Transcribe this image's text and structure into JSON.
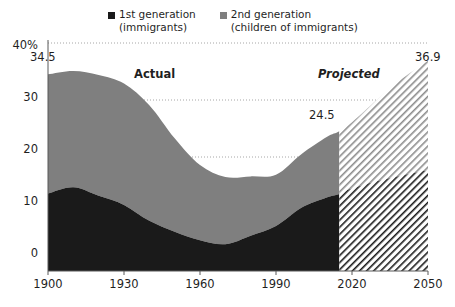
{
  "chart_data": {
    "type": "area",
    "subtype": "stacked-area",
    "title": "",
    "xlabel": "",
    "ylabel": "",
    "xlim": [
      1900,
      2050
    ],
    "ylim": [
      0,
      40
    ],
    "xticks": [
      "1900",
      "1930",
      "1960",
      "1990",
      "2020",
      "2050"
    ],
    "xtick_values": [
      1900,
      1930,
      1960,
      1990,
      2020,
      2050
    ],
    "yticks": [
      "0",
      "10",
      "20",
      "30",
      "40%"
    ],
    "ytick_values": [
      0,
      10,
      20,
      30,
      40
    ],
    "grid": "horizontal-dotted",
    "legend_position": "top-center",
    "projection_start_year": 2015,
    "series": [
      {
        "name": "1st generation (immigrants)",
        "color": "#1a1a1a",
        "x": [
          1900,
          1910,
          1920,
          1930,
          1940,
          1950,
          1960,
          1970,
          1980,
          1990,
          2000,
          2010,
          2015,
          2020,
          2030,
          2040,
          2050
        ],
        "values": [
          13.6,
          14.7,
          13.2,
          11.6,
          8.8,
          6.9,
          5.4,
          4.7,
          6.2,
          7.9,
          11.1,
          12.9,
          13.5,
          14.5,
          15.8,
          16.8,
          17.7
        ]
      },
      {
        "name": "2nd generation (children of immigrants)",
        "color": "#7f7f7f",
        "x": [
          1900,
          1910,
          1920,
          1930,
          1940,
          1950,
          1960,
          1970,
          1980,
          1990,
          2000,
          2010,
          2015,
          2020,
          2030,
          2040,
          2050
        ],
        "values": [
          20.9,
          20.4,
          21.2,
          21.3,
          20.3,
          16.4,
          13.2,
          11.8,
          10.4,
          9.0,
          9.4,
          10.6,
          11.0,
          11.6,
          14.3,
          17.0,
          19.2
        ]
      }
    ],
    "totals": {
      "x": [
        1900,
        1910,
        1920,
        1930,
        1940,
        1950,
        1960,
        1970,
        1980,
        1990,
        2000,
        2010,
        2015,
        2020,
        2030,
        2040,
        2050
      ],
      "values": [
        34.5,
        35.1,
        34.4,
        32.9,
        29.1,
        23.3,
        18.6,
        16.5,
        16.6,
        16.9,
        20.5,
        23.5,
        24.5,
        26.1,
        30.1,
        33.8,
        36.9
      ]
    },
    "data_labels": [
      {
        "text": "34.5",
        "x_value": 1900,
        "y_value": 34.5
      },
      {
        "text": "24.5",
        "x_value": 2015,
        "y_value": 24.5
      },
      {
        "text": "36.9",
        "x_value": 2050,
        "y_value": 36.9
      }
    ],
    "annotations": [
      {
        "text": "Actual",
        "style": "bold",
        "x_value": 1928,
        "y_value": 36.5
      },
      {
        "text": "Projected",
        "style": "bold-italic",
        "x_value": 2022,
        "y_value": 36.5
      }
    ]
  },
  "legend": {
    "items": [
      {
        "label": "1st generation\n(immigrants)",
        "color": "#1a1a1a",
        "swatch": "square-dark"
      },
      {
        "label": "2nd generation\n(children of immigrants)",
        "color": "#7f7f7f",
        "swatch": "square-gray"
      }
    ]
  },
  "axes": {
    "y_labels": [
      "40%",
      "30",
      "20",
      "10",
      "0"
    ],
    "x_labels": [
      "1900",
      "1930",
      "1960",
      "1990",
      "2020",
      "2050"
    ]
  },
  "annotations": {
    "actual": "Actual",
    "projected": "Projected",
    "label_start": "34.5",
    "label_mid": "24.5",
    "label_end": "36.9"
  },
  "colors": {
    "first_generation": "#1a1a1a",
    "second_generation": "#7f7f7f",
    "axis": "#595959",
    "grid": "#a6a6a6",
    "background": "#ffffff"
  }
}
